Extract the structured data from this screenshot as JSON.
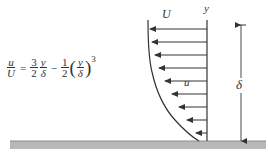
{
  "equation": {
    "lhs_num": "u",
    "lhs_den": "U",
    "equals": "=",
    "term1_coef_num": "3",
    "term1_coef_den": "2",
    "term1_var_num": "y",
    "term1_var_den": "δ",
    "minus": "−",
    "term2_coef_num": "1",
    "term2_coef_den": "2",
    "term2_var_num": "y",
    "term2_var_den": "δ",
    "paren_open": "(",
    "paren_close": ")",
    "exponent": "3"
  },
  "labels": {
    "free_stream_velocity": "U",
    "local_velocity": "u",
    "y_axis": "y",
    "boundary_layer_thickness": "δ"
  },
  "profile": {
    "type": "cubic boundary-layer velocity profile",
    "formula": "u/U = 1.5(y/δ) - 0.5(y/δ)^3",
    "arrow_rows_y": [
      29,
      42,
      55,
      68,
      81,
      94,
      107,
      120,
      133
    ],
    "arrow_tip_x": [
      150,
      152,
      155,
      159,
      165,
      172,
      179,
      187,
      196
    ]
  },
  "colors": {
    "ink": "#333333",
    "plate": "#b8b8b8",
    "plate_edge": "#8c8c8c"
  }
}
